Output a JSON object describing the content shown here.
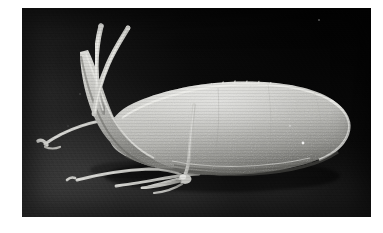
{
  "figure": {
    "kind": "scanning-electron-micrograph",
    "caption": "",
    "plate": {
      "left": 22,
      "top": 8,
      "width": 349,
      "height": 209,
      "page_background": "#ffffff",
      "background_dark": "#060606",
      "background_light": "#3c3c3c"
    }
  },
  "subject": {
    "name": "copepod-specimen",
    "description": "Lateral view of a small crustacean with elongate ovoid body, two long curved anterior antennae and several slender thoracic appendages",
    "orientation": "head-left-tail-right",
    "body_tone_light": "#d6d6d2",
    "body_tone_mid": "#b2b2ae",
    "body_tone_shadow": "#6e6e6a",
    "appendage_tone": "#c9c9c5"
  },
  "parts": [
    {
      "id": "antenna-upper-left",
      "label": "Antenna (left, upper)",
      "type": "appendage"
    },
    {
      "id": "antenna-upper-right",
      "label": "Antenna (right, upper)",
      "type": "appendage"
    },
    {
      "id": "prosome",
      "label": "Prosome (main body)",
      "type": "body"
    },
    {
      "id": "cephalic-neck",
      "label": "Cephalic neck region",
      "type": "body"
    },
    {
      "id": "urosome-tip",
      "label": "Posterior rounded end",
      "type": "body"
    },
    {
      "id": "leg-anterior-upper",
      "label": "Anterior leg (upper)",
      "type": "appendage"
    },
    {
      "id": "leg-anterior-lower",
      "label": "Anterior leg (lower)",
      "type": "appendage"
    },
    {
      "id": "leg-mid-ventral",
      "label": "Mid ventral appendage",
      "type": "appendage"
    },
    {
      "id": "leg-posterior",
      "label": "Posterior leg",
      "type": "appendage"
    },
    {
      "id": "dorsal-setae",
      "label": "Dorsal setae row",
      "type": "surface"
    }
  ],
  "annotations": {
    "scale_bar": "",
    "magnification": "",
    "label_text": ""
  }
}
